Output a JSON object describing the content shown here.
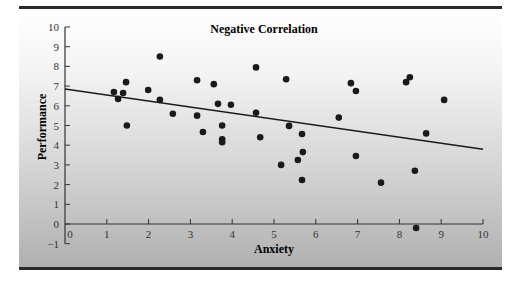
{
  "chart_data": {
    "type": "scatter",
    "title": "Negative Correlation",
    "xlabel": "Anxiety",
    "ylabel": "Performance",
    "xlim": [
      0,
      10
    ],
    "ylim": [
      -1,
      10
    ],
    "x_ticks": [
      0,
      1,
      2,
      3,
      4,
      5,
      6,
      7,
      8,
      9,
      10
    ],
    "y_ticks": [
      -1,
      0,
      1,
      2,
      3,
      4,
      5,
      6,
      7,
      8,
      9,
      10
    ],
    "grid": false,
    "legend": null,
    "points": [
      {
        "x": 1.17,
        "y": 6.7
      },
      {
        "x": 1.27,
        "y": 6.35
      },
      {
        "x": 1.39,
        "y": 6.65
      },
      {
        "x": 1.46,
        "y": 7.2
      },
      {
        "x": 1.48,
        "y": 5.0
      },
      {
        "x": 1.99,
        "y": 6.8
      },
      {
        "x": 2.27,
        "y": 8.5
      },
      {
        "x": 2.27,
        "y": 6.3
      },
      {
        "x": 2.58,
        "y": 5.6
      },
      {
        "x": 3.16,
        "y": 7.3
      },
      {
        "x": 3.16,
        "y": 5.5
      },
      {
        "x": 3.3,
        "y": 4.67
      },
      {
        "x": 3.56,
        "y": 7.1
      },
      {
        "x": 3.66,
        "y": 6.1
      },
      {
        "x": 3.76,
        "y": 5.0
      },
      {
        "x": 3.76,
        "y": 4.3
      },
      {
        "x": 3.76,
        "y": 4.15
      },
      {
        "x": 3.97,
        "y": 6.05
      },
      {
        "x": 4.57,
        "y": 7.95
      },
      {
        "x": 4.57,
        "y": 5.65
      },
      {
        "x": 4.67,
        "y": 4.4
      },
      {
        "x": 5.17,
        "y": 3.0
      },
      {
        "x": 5.29,
        "y": 7.35
      },
      {
        "x": 5.36,
        "y": 4.98
      },
      {
        "x": 5.57,
        "y": 3.25
      },
      {
        "x": 5.67,
        "y": 4.57
      },
      {
        "x": 5.69,
        "y": 3.65
      },
      {
        "x": 5.67,
        "y": 2.23
      },
      {
        "x": 6.55,
        "y": 5.4
      },
      {
        "x": 6.84,
        "y": 7.15
      },
      {
        "x": 6.96,
        "y": 6.75
      },
      {
        "x": 6.96,
        "y": 3.45
      },
      {
        "x": 7.56,
        "y": 2.1
      },
      {
        "x": 8.16,
        "y": 7.2
      },
      {
        "x": 8.25,
        "y": 7.45
      },
      {
        "x": 8.37,
        "y": 2.7
      },
      {
        "x": 8.4,
        "y": -0.2
      },
      {
        "x": 8.64,
        "y": 4.6
      },
      {
        "x": 9.07,
        "y": 6.3
      }
    ],
    "trend_line": {
      "x0": 0,
      "y0": 6.85,
      "x1": 10,
      "y1": 3.8
    },
    "colors": {
      "points": "#1a1a1a",
      "line": "#1a1a1a",
      "axis": "#333333"
    }
  }
}
